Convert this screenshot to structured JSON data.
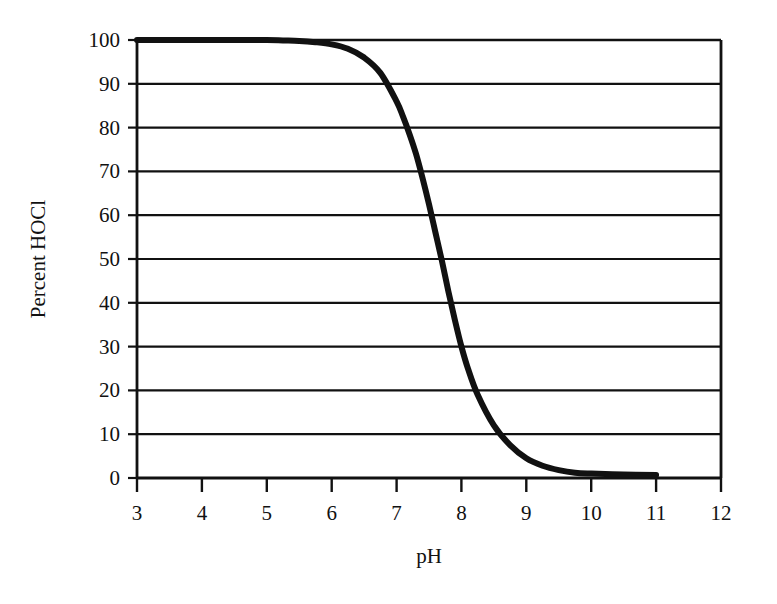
{
  "chart_data": {
    "type": "line",
    "title": "",
    "xlabel": "pH",
    "ylabel": "Percent HOCl",
    "xlim": [
      3,
      12
    ],
    "ylim": [
      0,
      100
    ],
    "xticks": [
      3,
      4,
      5,
      6,
      7,
      8,
      9,
      10,
      11,
      12
    ],
    "xtick_labels": [
      "3",
      "4",
      "5",
      "6",
      "7",
      "8",
      "9",
      "10",
      "11",
      "12"
    ],
    "yticks": [
      0,
      10,
      20,
      30,
      40,
      50,
      60,
      70,
      80,
      90,
      100
    ],
    "ytick_labels": [
      "0",
      "10",
      "20",
      "30",
      "40",
      "50",
      "60",
      "70",
      "80",
      "90",
      "100"
    ],
    "grid": "horizontal",
    "legend": "none",
    "line_color": "#111111",
    "line_width": 6,
    "series": [
      {
        "name": "Percent HOCl",
        "x": [
          3.0,
          3.5,
          4.0,
          4.5,
          5.0,
          5.25,
          5.5,
          5.75,
          6.0,
          6.25,
          6.5,
          6.75,
          7.0,
          7.1,
          7.2,
          7.3,
          7.4,
          7.5,
          7.6,
          7.7,
          7.8,
          7.9,
          8.0,
          8.1,
          8.25,
          8.5,
          8.75,
          9.0,
          9.25,
          9.5,
          9.75,
          10.0,
          10.5,
          11.0
        ],
        "y": [
          100.0,
          100.0,
          100.0,
          100.0,
          100.0,
          99.9,
          99.8,
          99.5,
          99.0,
          98.0,
          96.0,
          92.5,
          86.0,
          82.5,
          78.5,
          74.0,
          68.5,
          62.5,
          56.0,
          49.5,
          42.5,
          36.0,
          30.0,
          25.0,
          19.0,
          12.0,
          7.5,
          4.5,
          2.8,
          1.8,
          1.2,
          1.0,
          0.8,
          0.7
        ]
      }
    ],
    "curve_notes": {
      "plateau_high_percent": "100",
      "plateau_high_max_ph": "5.5",
      "midpoint_ph": "7.7",
      "midpoint_percent": "50",
      "plateau_low_percent": "1",
      "plateau_low_min_ph": "9.7",
      "curve_end_ph": "11"
    }
  }
}
